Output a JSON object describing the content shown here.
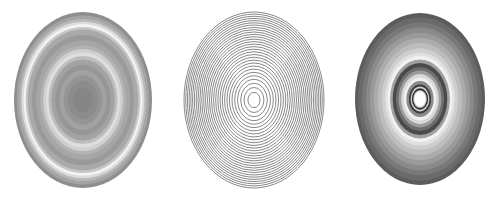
{
  "figure": {
    "panels": [
      {
        "id": "left",
        "style": "filled-bands",
        "bands_outer_to_inner": [
          {
            "r": 1.0,
            "color": "#8e8e8e"
          },
          {
            "r": 0.96,
            "color": "#a4a4a4"
          },
          {
            "r": 0.92,
            "color": "#b9b9b9"
          },
          {
            "r": 0.89,
            "color": "#dcdcdc"
          },
          {
            "r": 0.86,
            "color": "#f4f4f4"
          },
          {
            "r": 0.83,
            "color": "#c6c6c6"
          },
          {
            "r": 0.8,
            "color": "#a9a9a9"
          },
          {
            "r": 0.74,
            "color": "#9a9a9a"
          },
          {
            "r": 0.68,
            "color": "#a6a6a6"
          },
          {
            "r": 0.62,
            "color": "#b3b3b3"
          },
          {
            "r": 0.58,
            "color": "#cfcfcf"
          },
          {
            "r": 0.54,
            "color": "#dedede"
          },
          {
            "r": 0.5,
            "color": "#bdbdbd"
          },
          {
            "r": 0.46,
            "color": "#a3a3a3"
          },
          {
            "r": 0.4,
            "color": "#969696"
          },
          {
            "r": 0.34,
            "color": "#a2a2a2"
          },
          {
            "r": 0.28,
            "color": "#959595"
          },
          {
            "r": 0.22,
            "color": "#8c8c8c"
          },
          {
            "r": 0.14,
            "color": "#868686"
          }
        ]
      },
      {
        "id": "middle",
        "style": "line-rings",
        "ring_count": 30,
        "stroke_color": "#7a7a7a",
        "spacing_exponent": 0.72
      },
      {
        "id": "right",
        "style": "filled-bands",
        "bands_outer_to_inner": [
          {
            "r": 1.0,
            "color": "#5c5c5c"
          },
          {
            "r": 0.95,
            "color": "#6a6a6a"
          },
          {
            "r": 0.89,
            "color": "#787878"
          },
          {
            "r": 0.83,
            "color": "#8a8a8a"
          },
          {
            "r": 0.77,
            "color": "#9a9a9a"
          },
          {
            "r": 0.71,
            "color": "#acacac"
          },
          {
            "r": 0.65,
            "color": "#bdbdbd"
          },
          {
            "r": 0.59,
            "color": "#cecece"
          },
          {
            "r": 0.54,
            "color": "#e0e0e0"
          },
          {
            "r": 0.5,
            "color": "#f2f2f2"
          },
          {
            "r": 0.46,
            "color": "#a0a0a0"
          },
          {
            "r": 0.42,
            "color": "#4a4a4a"
          },
          {
            "r": 0.37,
            "color": "#6e6e6e"
          },
          {
            "r": 0.33,
            "color": "#9c9c9c"
          },
          {
            "r": 0.29,
            "color": "#d8d8d8"
          },
          {
            "r": 0.25,
            "color": "#f0f0f0"
          },
          {
            "r": 0.21,
            "color": "#8a8a8a"
          },
          {
            "r": 0.17,
            "color": "#3a3a3a"
          },
          {
            "r": 0.145,
            "color": "#d0d0d0"
          },
          {
            "r": 0.125,
            "color": "#2e2e2e"
          },
          {
            "r": 0.105,
            "color": "#bdbdbd"
          },
          {
            "r": 0.09,
            "color": "#ffffff"
          }
        ]
      }
    ]
  }
}
